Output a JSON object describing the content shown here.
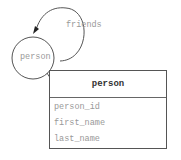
{
  "diagram": {
    "node": {
      "label": "person"
    },
    "self_edge": {
      "label": "friends"
    },
    "table": {
      "title": "person",
      "fields": [
        "person_id",
        "first_name",
        "last_name"
      ]
    },
    "colors": {
      "stroke": "#555555",
      "muted_text": "#999999",
      "header_text": "#333333"
    }
  }
}
